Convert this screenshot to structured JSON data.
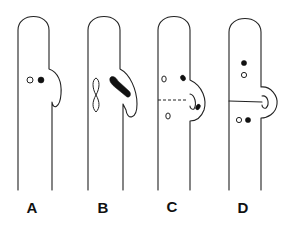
{
  "figure": {
    "colors": {
      "line": "#222222",
      "fill_nucleus": "#111111",
      "background": "#ffffff"
    },
    "panels": [
      {
        "id": "A",
        "label": "A",
        "stage": "hook cell begins; one open and one filled nucleus side by side"
      },
      {
        "id": "B",
        "label": "B",
        "stage": "nuclei dividing; filled nucleus elongates into hook, open nucleus figure-eight"
      },
      {
        "id": "C",
        "label": "C",
        "stage": "hook curves back; dashed line marks forming septum"
      },
      {
        "id": "D",
        "label": "D",
        "stage": "septum complete; clamp fused; each cell with one open and one filled nucleus"
      }
    ]
  }
}
